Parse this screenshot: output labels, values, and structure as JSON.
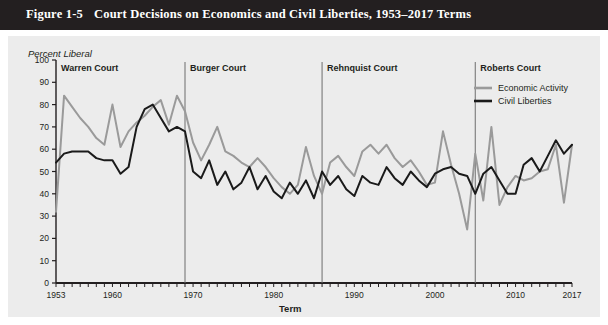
{
  "title": {
    "number": "Figure 1-5",
    "text": "Court Decisions on Economics and Civil Liberties, 1953–2017 Terms"
  },
  "chart_data": {
    "type": "line",
    "title": "Court Decisions on Economics and Civil Liberties, 1953–2017 Terms",
    "xlabel": "Term",
    "ylabel": "Percent Liberal",
    "xlim": [
      1953,
      2017
    ],
    "ylim": [
      0,
      100
    ],
    "grid": false,
    "legend_position": "top-right",
    "ytick_labels": [
      "0",
      "10",
      "20",
      "30",
      "40",
      "50",
      "60",
      "70",
      "80",
      "90",
      "100"
    ],
    "ytick_values": [
      0,
      10,
      20,
      30,
      40,
      50,
      60,
      70,
      80,
      90,
      100
    ],
    "xtick_labels": [
      "1953",
      "1960",
      "1970",
      "1980",
      "1990",
      "2000",
      "2010",
      "2017"
    ],
    "xtick_values": [
      1953,
      1960,
      1970,
      1980,
      1990,
      2000,
      2010,
      2017
    ],
    "x": [
      1953,
      1954,
      1955,
      1956,
      1957,
      1958,
      1959,
      1960,
      1961,
      1962,
      1963,
      1964,
      1965,
      1966,
      1967,
      1968,
      1969,
      1970,
      1971,
      1972,
      1973,
      1974,
      1975,
      1976,
      1977,
      1978,
      1979,
      1980,
      1981,
      1982,
      1983,
      1984,
      1985,
      1986,
      1987,
      1988,
      1989,
      1990,
      1991,
      1992,
      1993,
      1994,
      1995,
      1996,
      1997,
      1998,
      1999,
      2000,
      2001,
      2002,
      2003,
      2004,
      2005,
      2006,
      2007,
      2008,
      2009,
      2010,
      2011,
      2012,
      2013,
      2014,
      2015,
      2016,
      2017
    ],
    "series": [
      {
        "name": "Economic Activity",
        "color": "#9a9a9a",
        "values": [
          32,
          84,
          79,
          74,
          70,
          65,
          62,
          80,
          61,
          68,
          72,
          75,
          79,
          82,
          71,
          84,
          77,
          63,
          55,
          62,
          70,
          59,
          57,
          54,
          52,
          56,
          52,
          47,
          43,
          40,
          44,
          61,
          48,
          40,
          54,
          57,
          52,
          48,
          59,
          62,
          58,
          62,
          56,
          52,
          55,
          50,
          44,
          45,
          68,
          53,
          40,
          24,
          58,
          37,
          70,
          35,
          43,
          48,
          46,
          47,
          50,
          51,
          62,
          36,
          62
        ]
      },
      {
        "name": "Civil Liberties",
        "color": "#1a1a1a",
        "values": [
          54,
          58,
          59,
          59,
          59,
          56,
          55,
          55,
          49,
          52,
          70,
          78,
          80,
          74,
          68,
          70,
          68,
          50,
          47,
          55,
          44,
          50,
          42,
          45,
          52,
          42,
          48,
          41,
          38,
          45,
          40,
          46,
          38,
          50,
          44,
          48,
          42,
          39,
          48,
          45,
          44,
          52,
          47,
          44,
          50,
          46,
          43,
          49,
          51,
          52,
          49,
          48,
          40,
          49,
          52,
          46,
          40,
          40,
          53,
          56,
          50,
          57,
          64,
          58,
          62
        ]
      }
    ],
    "eras": [
      {
        "name": "Warren Court",
        "start": 1953,
        "end": 1968
      },
      {
        "name": "Burger Court",
        "start": 1969,
        "end": 1985
      },
      {
        "name": "Rehnquist Court",
        "start": 1986,
        "end": 2004
      },
      {
        "name": "Roberts Court",
        "start": 2005,
        "end": 2017
      }
    ],
    "era_dividers": [
      1969,
      1986,
      2005
    ]
  }
}
